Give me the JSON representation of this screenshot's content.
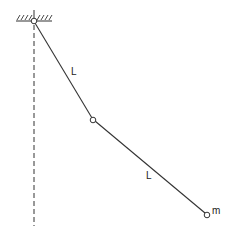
{
  "diagram": {
    "labels": {
      "upper_rod": "L",
      "lower_rod": "L",
      "mass": "m"
    },
    "colors": {
      "line": "#333333",
      "background": "#ffffff"
    }
  }
}
